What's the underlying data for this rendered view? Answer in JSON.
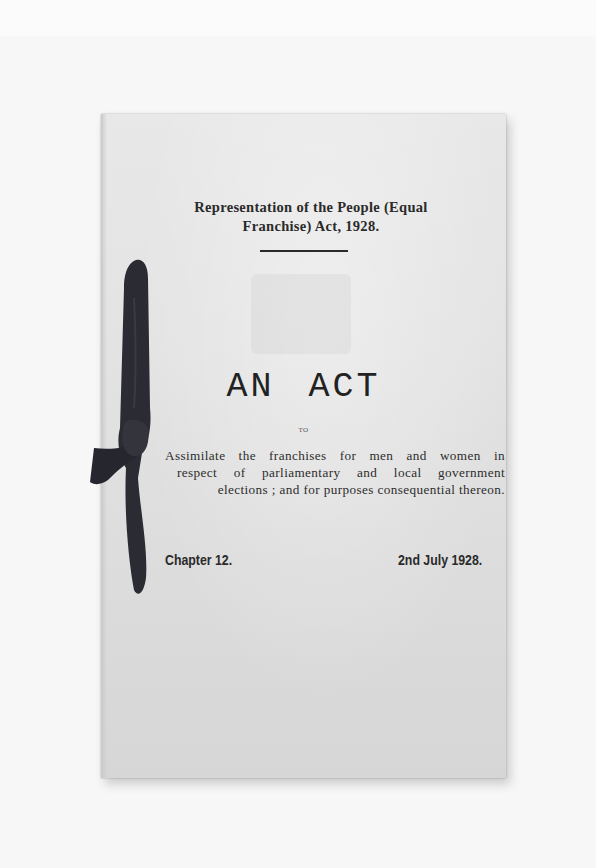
{
  "document": {
    "title_line1": "Representation of the People (Equal",
    "title_line2": "Franchise) Act, 1928.",
    "heading": "AN ACT",
    "to_label": "TO",
    "description_lines": [
      "Assimilate the franchises for men and women in",
      "respect of parliamentary and local government",
      "elections ; and for purposes consequential thereon."
    ],
    "chapter": "Chapter 12.",
    "date": "2nd July 1928."
  },
  "colors": {
    "paper": "#e3e3e3",
    "ink": "#2a2a2a",
    "ribbon": "#2b2b33",
    "background": "#fbfbfb"
  }
}
